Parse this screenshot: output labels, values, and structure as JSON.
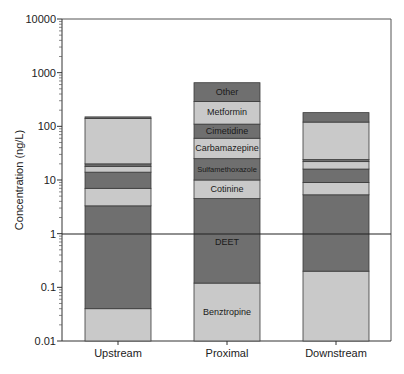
{
  "chart_data": {
    "type": "bar",
    "stacked": true,
    "title": "",
    "xlabel": "",
    "ylabel": "Concentration (ng/L)",
    "yscale": "log",
    "ylim": [
      0.01,
      10000
    ],
    "yticks": [
      "0.01",
      "0.1",
      "1",
      "10",
      "100",
      "1000",
      "10000"
    ],
    "reference_line": {
      "y": 1
    },
    "grid": false,
    "legend": "none (segments labeled inside Proximal bar)",
    "categories": [
      "Upstream",
      "Proximal",
      "Downstream"
    ],
    "cumulative_tops_note": "Values are cumulative upper bounds of each stacked segment (ng/L), read off log axis",
    "series": [
      {
        "name": "Benztropine",
        "color": "#c9c9c9",
        "tops": [
          0.04,
          0.12,
          0.2
        ]
      },
      {
        "name": "DEET",
        "color": "#6f6f6f",
        "tops": [
          3.3,
          4.5,
          5.3
        ]
      },
      {
        "name": "Cotinine",
        "color": "#c9c9c9",
        "tops": [
          7,
          10,
          9
        ]
      },
      {
        "name": "Sulfamethoxazole",
        "color": "#6f6f6f",
        "tops": [
          14,
          25,
          16
        ]
      },
      {
        "name": "Carbamazepine",
        "color": "#c9c9c9",
        "tops": [
          18,
          60,
          22
        ]
      },
      {
        "name": "Cimetidine",
        "color": "#6f6f6f",
        "tops": [
          20,
          110,
          24
        ]
      },
      {
        "name": "Metformin",
        "color": "#c9c9c9",
        "tops": [
          140,
          290,
          120
        ]
      },
      {
        "name": "Other",
        "color": "#6f6f6f",
        "tops": [
          150,
          650,
          180
        ]
      }
    ]
  },
  "axis": {
    "ylabel": "Concentration (ng/L)",
    "ytick_labels": [
      "10000",
      "1000",
      "100",
      "10",
      "1",
      "0.1",
      "0.01"
    ],
    "categories": [
      "Upstream",
      "Proximal",
      "Downstream"
    ]
  },
  "segment_labels": {
    "other": "Other",
    "metformin": "Metformin",
    "cimetidine": "Cimetidine",
    "carbamazepine": "Carbamazepine",
    "sulfamethoxazole": "Sulfamethoxazole",
    "cotinine": "Cotinine",
    "deet": "DEET",
    "benztropine": "Benztropine"
  },
  "colors": {
    "light": "#c9c9c9",
    "dark": "#6f6f6f",
    "edge": "#3a3a3a",
    "axis": "#333333"
  }
}
